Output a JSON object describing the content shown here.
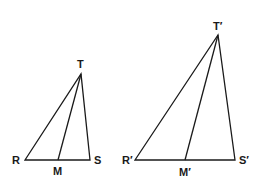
{
  "diagram": {
    "triangles": [
      {
        "name": "RST",
        "points": {
          "R": [
            25,
            160
          ],
          "S": [
            90,
            160
          ],
          "T": [
            81,
            74
          ],
          "M": [
            58,
            160
          ]
        },
        "labels": {
          "T": "T",
          "R": "R",
          "M": "M",
          "S": "S"
        }
      },
      {
        "name": "R'S'T'",
        "points": {
          "R": [
            135,
            160
          ],
          "S": [
            235,
            160
          ],
          "T": [
            218,
            35
          ],
          "M": [
            185,
            160
          ]
        },
        "labels": {
          "T": "T′",
          "R": "R′",
          "M": "M′",
          "S": "S′"
        }
      }
    ],
    "line_color": "#1a1a1a"
  }
}
